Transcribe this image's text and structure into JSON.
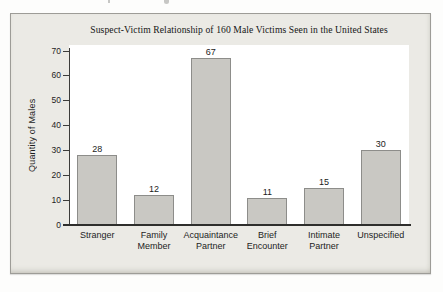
{
  "figure": {
    "title": "Suspect-Victim Relationship of 160 Male Victims Seen in the United States",
    "ylabel": "Quantity of Males"
  },
  "chart_data": {
    "type": "bar",
    "title": "Suspect-Victim Relationship of 160 Male Victims Seen in the United States",
    "xlabel": "",
    "ylabel": "Quantity of Males",
    "categories": [
      "Stranger",
      "Family Member",
      "Acquaintance Partner",
      "Brief Encounter",
      "Intimate Partner",
      "Unspecified"
    ],
    "values": [
      28,
      12,
      67,
      11,
      15,
      30
    ],
    "ylim": [
      0,
      70
    ],
    "yticks": [
      0,
      10,
      20,
      30,
      40,
      50,
      60,
      70
    ],
    "bar_value_labels": true,
    "grid": false,
    "legend": null,
    "colors": {
      "bar_fill": "#c9c8c3",
      "bar_border": "#8d8d8a",
      "panel_background": "#ebeae5",
      "plot_background": "#ffffff",
      "axis": "#2e2e2c",
      "text": "#1d1d1d"
    }
  }
}
